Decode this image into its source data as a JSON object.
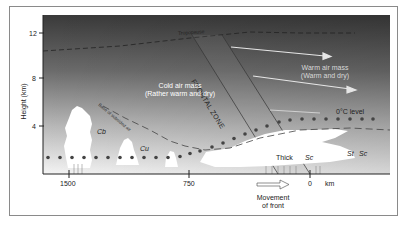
{
  "diagram": {
    "y_axis": {
      "label": "Height (km)",
      "ticks": [
        "12",
        "8",
        "4"
      ]
    },
    "x_axis": {
      "ticks": [
        "1500",
        "750",
        "0"
      ],
      "unit": "km"
    },
    "labels": {
      "tropopause": "Tropopause",
      "frontal_zone": "FRONTAL ZONE",
      "cold_air_mass_title": "Cold air mass",
      "cold_air_mass_sub": "(Rather warm and dry)",
      "warm_air_mass_title": "Warm air mass",
      "warm_air_mass_sub": "(Warm and dry)",
      "zero_c_level": "0°C level",
      "base_of_subsided_air": "Base of subsided air",
      "cb": "Cb",
      "cu": "Cu",
      "thick": "Thick",
      "sc_center": "Sc",
      "st": "St",
      "sc_right": "Sc",
      "movement_line1": "Movement",
      "movement_line2": "of front"
    },
    "colors": {
      "sky_top": "#3a3a3a",
      "sky_bottom": "#f2f2f2",
      "cloud": "#ffffff",
      "dots": "#444444",
      "arrows": "#e6e6e6"
    }
  }
}
